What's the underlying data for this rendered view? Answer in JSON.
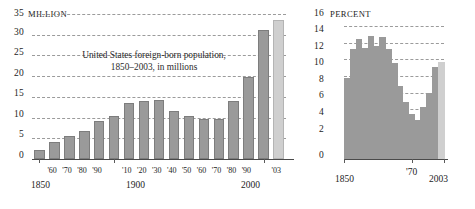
{
  "chart_data": [
    {
      "type": "bar",
      "id": "foreign-born-millions",
      "title": "United States foreign-born population,\n1850–2003, in millions",
      "unit_label": "MILLION",
      "xlabel": "",
      "ylabel": "",
      "ylim": [
        0,
        35
      ],
      "yticks": [
        0,
        5,
        10,
        15,
        20,
        25,
        30,
        35
      ],
      "ytick_labels": [
        "0",
        "5",
        "10",
        "15",
        "20",
        "25",
        "30",
        "35"
      ],
      "grid": true,
      "categories": [
        "1850",
        "'60",
        "'70",
        "'80",
        "'90",
        "1900",
        "'10",
        "'20",
        "'30",
        "'40",
        "'50",
        "'60",
        "'70",
        "'80",
        "'90",
        "2000",
        "'03"
      ],
      "xtick_labels_major": [
        "1850",
        "1900",
        "2000"
      ],
      "values": [
        2.2,
        4.1,
        5.6,
        6.7,
        9.2,
        10.3,
        13.5,
        13.9,
        14.2,
        11.6,
        10.3,
        9.7,
        9.6,
        14.1,
        19.8,
        31.1,
        33.5
      ],
      "highlight_index": 16,
      "legend": []
    },
    {
      "type": "area",
      "id": "foreign-born-percent",
      "title": "Foreign-born\npopulation as\npercent of total",
      "unit_label": "PERCENT",
      "xlabel": "",
      "ylabel": "",
      "ylim": [
        0,
        16
      ],
      "yticks": [
        0,
        2,
        4,
        6,
        8,
        10,
        12,
        14,
        16
      ],
      "ytick_labels": [
        "0",
        "2",
        "4",
        "6",
        "8",
        "10",
        "12",
        "14",
        "16"
      ],
      "grid": true,
      "categories": [
        "1850",
        "1860",
        "1870",
        "1880",
        "1890",
        "1900",
        "1910",
        "1920",
        "1930",
        "1940",
        "1950",
        "1960",
        "1970",
        "1980",
        "1990",
        "2000",
        "2003"
      ],
      "xtick_labels_major": [
        "1850",
        "'70",
        "2003"
      ],
      "values": [
        9.7,
        13.2,
        14.4,
        13.3,
        14.8,
        13.6,
        14.7,
        13.2,
        11.6,
        8.8,
        6.9,
        5.4,
        4.7,
        6.2,
        7.9,
        11.1,
        11.7
      ],
      "highlight_index": 16,
      "legend": []
    }
  ],
  "left": {
    "unit": "MILLION",
    "axis_top": "35",
    "y": [
      "35",
      "30",
      "25",
      "20",
      "15",
      "10",
      "5",
      "0"
    ],
    "caption": "United States foreign-born population,\n1850–2003, in millions",
    "x_small": [
      "'60",
      "'70",
      "'80",
      "'90",
      "'10",
      "'20",
      "'30",
      "'40",
      "'50",
      "'60",
      "'70",
      "'80",
      "'90",
      "'03"
    ],
    "x_1850": "1850",
    "x_1900": "1900",
    "x_2000": "2000"
  },
  "right": {
    "unit": "PERCENT",
    "axis_top": "16",
    "y": [
      "16",
      "14",
      "12",
      "10",
      "8",
      "6",
      "4",
      "2",
      "0"
    ],
    "caption": "Foreign-born\npopulation as\npercent of total",
    "x_1850": "1850",
    "x_70": "'70",
    "x_2003": "2003"
  },
  "colors": {
    "bar": "#9a9a9a",
    "bar_highlight": "#cfcfcf",
    "grid": "#8a8a8a",
    "axis": "#4a4a4a",
    "text": "#1c1c1c",
    "background": "#ffffff"
  }
}
